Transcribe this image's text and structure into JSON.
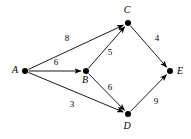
{
  "figure": {
    "type": "directed-weighted-graph",
    "background_color": "#ffffff",
    "stroke_color": "#1a1a1a",
    "node_color": "#000000"
  },
  "graph": {
    "nodes": [
      {
        "id": "A",
        "label": "A",
        "x": 25,
        "y": 71,
        "label_x": 15,
        "label_y": 71,
        "label_anchor": "middle"
      },
      {
        "id": "B",
        "label": "B",
        "x": 86,
        "y": 71,
        "label_x": 85,
        "label_y": 81,
        "label_anchor": "middle"
      },
      {
        "id": "C",
        "label": "C",
        "x": 128,
        "y": 23,
        "label_x": 127,
        "label_y": 11,
        "label_anchor": "middle"
      },
      {
        "id": "D",
        "label": "D",
        "x": 128,
        "y": 114,
        "label_x": 127,
        "label_y": 127,
        "label_anchor": "middle"
      },
      {
        "id": "E",
        "label": "E",
        "x": 170,
        "y": 71,
        "label_x": 180,
        "label_y": 72,
        "label_anchor": "middle"
      }
    ],
    "edges": [
      {
        "from": "A",
        "to": "C",
        "weight": "8",
        "weight_x": 67,
        "weight_y": 39
      },
      {
        "from": "A",
        "to": "B",
        "weight": "6",
        "weight_x": 56,
        "weight_y": 63
      },
      {
        "from": "A",
        "to": "D",
        "weight": "3",
        "weight_x": 72,
        "weight_y": 105
      },
      {
        "from": "B",
        "to": "C",
        "weight": "5",
        "weight_x": 110,
        "weight_y": 53
      },
      {
        "from": "B",
        "to": "D",
        "weight": "6",
        "weight_x": 110,
        "weight_y": 88
      },
      {
        "from": "C",
        "to": "E",
        "weight": "4",
        "weight_x": 157,
        "weight_y": 39
      },
      {
        "from": "D",
        "to": "E",
        "weight": "9",
        "weight_x": 156,
        "weight_y": 102
      }
    ]
  }
}
